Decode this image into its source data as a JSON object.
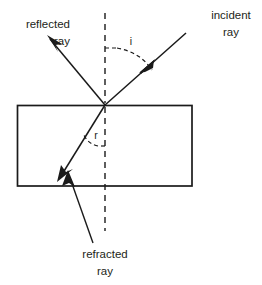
{
  "diagram": {
    "labels": {
      "reflected_line1": "reflected",
      "reflected_line2": "ray",
      "incident_line1": "incident",
      "incident_line2": "ray",
      "refracted_line1": "refracted",
      "refracted_line2": "ray",
      "angle_incidence": "i",
      "angle_refraction": "r"
    },
    "colors": {
      "stroke": "#1a1a1a",
      "text": "#231f20",
      "background": "#ffffff"
    },
    "geometry": {
      "incidence_point": [
        105,
        105
      ],
      "block": {
        "x": 17,
        "y": 105,
        "width": 175,
        "height": 81
      },
      "normal": {
        "x": 105,
        "y_top": 13,
        "y_bottom": 231
      },
      "incident_ray": {
        "from": [
          186,
          33
        ],
        "to": [
          105,
          105
        ]
      },
      "reflected_ray": {
        "from": [
          105,
          105
        ],
        "to": [
          47,
          36
        ]
      },
      "refracted_ray": {
        "from": [
          105,
          105
        ],
        "to": [
          58,
          180
        ]
      },
      "refracted_pointer": {
        "from": [
          93,
          245
        ],
        "to": [
          66,
          172
        ]
      }
    }
  }
}
